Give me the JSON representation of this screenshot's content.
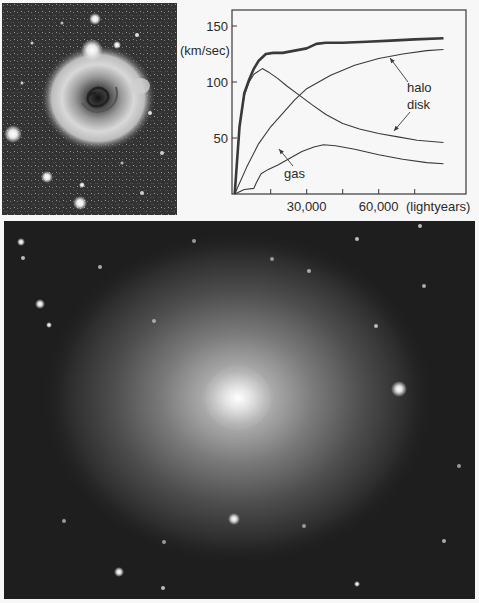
{
  "figure": {
    "panels": [
      {
        "id": "photo-top",
        "kind": "image",
        "description": "spiral galaxy with ring, star field (grayscale)"
      },
      {
        "id": "chart",
        "kind": "chart"
      },
      {
        "id": "photo-bottom",
        "kind": "image",
        "description": "galaxy with bright core and diffuse halo, star field (grayscale)"
      }
    ]
  },
  "chart_data": {
    "type": "line",
    "title": "",
    "xlabel": "(lightyears)",
    "ylabel": "(km/sec)",
    "xlim": [
      0,
      96000
    ],
    "ylim": [
      0,
      160
    ],
    "x_ticks": [
      15000,
      30000,
      45000,
      60000,
      75000
    ],
    "x_tick_labels": [
      {
        "value": 30000,
        "label": "30,000"
      },
      {
        "value": 60000,
        "label": "60,000"
      }
    ],
    "y_ticks": [
      {
        "value": 50,
        "label": "50"
      },
      {
        "value": 100,
        "label": "100"
      },
      {
        "value": 150,
        "label": "150"
      }
    ],
    "grid": false,
    "legend": "inline labels with arrows",
    "series": [
      {
        "name": "total",
        "style": "thick",
        "x": [
          0,
          2000,
          4000,
          6000,
          8000,
          10000,
          13000,
          16000,
          20000,
          25000,
          30000,
          34000,
          38000,
          45000,
          55000,
          65000,
          75000,
          87000
        ],
        "y": [
          0,
          60,
          90,
          102,
          112,
          119,
          125,
          126,
          126,
          128,
          130,
          134,
          135,
          135,
          136,
          137,
          138,
          139
        ]
      },
      {
        "name": "disk",
        "label": "disk",
        "x": [
          0,
          2000,
          4000,
          6000,
          8000,
          11500,
          14000,
          18000,
          22000,
          27000,
          32000,
          38000,
          45000,
          52000,
          60000,
          68000,
          76000,
          87000
        ],
        "y": [
          0,
          60,
          88,
          100,
          107,
          112,
          109,
          103,
          96,
          88,
          80,
          71,
          63,
          58,
          54,
          51,
          48,
          46
        ]
      },
      {
        "name": "halo",
        "label": "halo",
        "x": [
          0,
          5000,
          10000,
          15000,
          20000,
          25000,
          30000,
          35000,
          40000,
          50000,
          60000,
          70000,
          80000,
          87000
        ],
        "y": [
          0,
          24,
          45,
          60,
          72,
          84,
          94,
          100,
          106,
          115,
          121,
          125,
          128,
          129
        ]
      },
      {
        "name": "gas",
        "label": "gas",
        "x": [
          0,
          4000,
          8000,
          9000,
          11000,
          14000,
          18000,
          23000,
          28000,
          33000,
          37000,
          42000,
          50000,
          60000,
          70000,
          80000,
          87000
        ],
        "y": [
          0,
          4,
          5,
          10,
          18,
          22,
          26,
          32,
          38,
          42,
          44,
          43,
          40,
          35,
          31,
          28,
          27
        ]
      }
    ],
    "annotations": [
      {
        "text": "halo",
        "arrow_to_series": "halo"
      },
      {
        "text": "disk",
        "arrow_to_series": "disk"
      },
      {
        "text": "gas",
        "arrow_to_series": "gas"
      }
    ]
  },
  "colors": {
    "page_background": "#f7f7f7",
    "line": "#3a3a3a",
    "photo_background": "#262626"
  }
}
